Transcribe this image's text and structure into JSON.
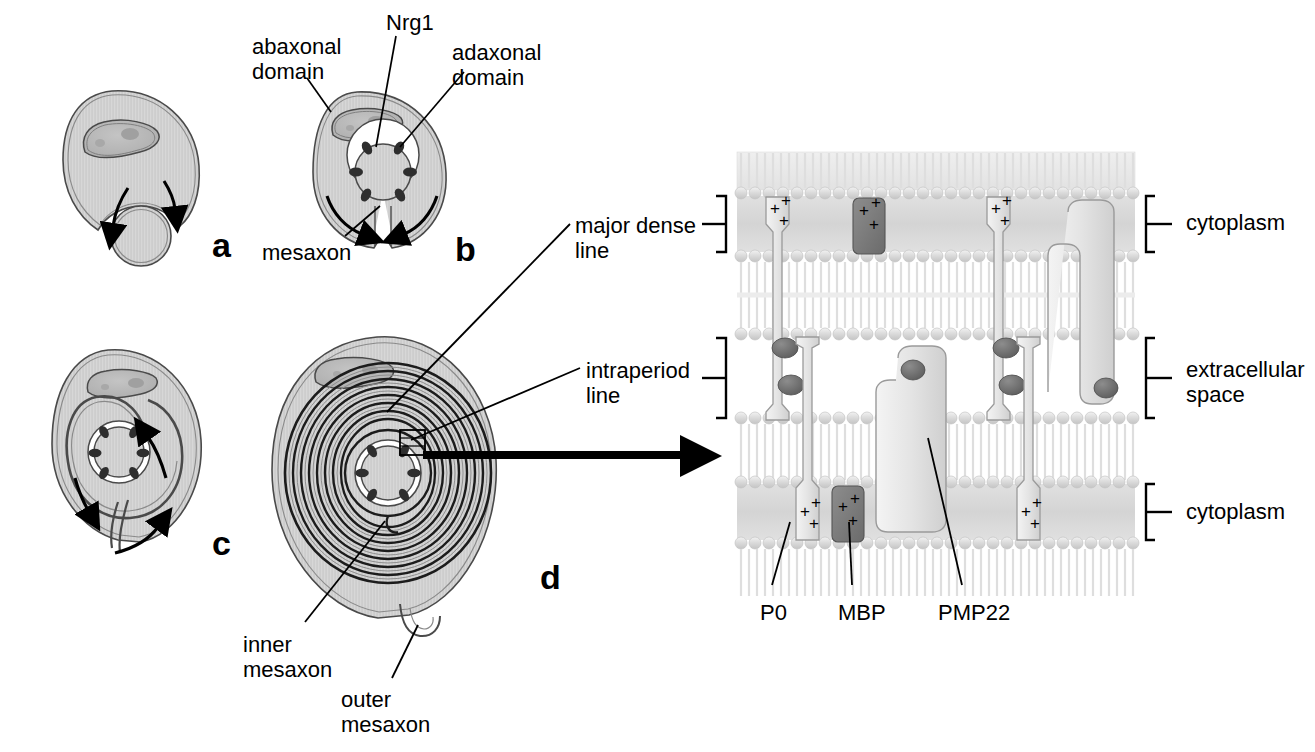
{
  "figure": {
    "background_color": "#ffffff",
    "ink_color": "#000000"
  },
  "panels": [
    {
      "id": "a",
      "letter": "a",
      "caption": "Schwann cell engulfing axon",
      "letter_x": 212,
      "letter_y": 228
    },
    {
      "id": "b",
      "letter": "b",
      "caption": "Axon surrounded, mesaxon formed",
      "letter_x": 455,
      "letter_y": 232
    },
    {
      "id": "c",
      "letter": "c",
      "caption": "Spiral wrapping begins",
      "letter_x": 212,
      "letter_y": 526
    },
    {
      "id": "d",
      "letter": "d",
      "caption": "Compact myelin with multiple lamellae",
      "letter_x": 540,
      "letter_y": 560
    }
  ],
  "annotations": {
    "abaxonal_domain": {
      "text": "abaxonal\ndomain",
      "x": 252,
      "y": 34
    },
    "nrg1": {
      "text": "Nrg1",
      "x": 386,
      "y": 10
    },
    "adaxonal_domain": {
      "text": "adaxonal\ndomain",
      "x": 452,
      "y": 40
    },
    "mesaxon": {
      "text": "mesaxon",
      "x": 262,
      "y": 240
    },
    "major_dense_line": {
      "text": "major dense\nline",
      "x": 575,
      "y": 213
    },
    "intraperiod_line": {
      "text": "intraperiod\nline",
      "x": 586,
      "y": 358
    },
    "inner_mesaxon": {
      "text": "inner\nmesaxon",
      "x": 243,
      "y": 632
    },
    "outer_mesaxon": {
      "text": "outer\nmesaxon",
      "x": 341,
      "y": 687
    },
    "cytoplasm_top": {
      "text": "cytoplasm",
      "x": 1186,
      "y": 210
    },
    "extracellular_space": {
      "text": "extracellular\nspace",
      "x": 1186,
      "y": 357
    },
    "cytoplasm_bottom": {
      "text": "cytoplasm",
      "x": 1186,
      "y": 499
    },
    "p0": {
      "text": "P0",
      "x": 760,
      "y": 600
    },
    "mbp": {
      "text": "MBP",
      "x": 838,
      "y": 600
    },
    "pmp22": {
      "text": "PMP22",
      "x": 938,
      "y": 600
    }
  },
  "membrane_diagram": {
    "proteins": [
      {
        "name": "P0",
        "role": "adhesion, extracellular Ig domain",
        "count": 4,
        "charge_marks": "+ + +"
      },
      {
        "name": "MBP",
        "role": "cytoplasmic, compacts major dense line",
        "count": 2,
        "charge_marks": "+ + +"
      },
      {
        "name": "PMP22",
        "role": "tetraspan transmembrane",
        "count": 2
      }
    ],
    "layers": [
      "cytoplasm",
      "membrane bilayer",
      "extracellular space",
      "membrane bilayer",
      "cytoplasm"
    ],
    "plus_symbol": "+"
  },
  "colors": {
    "cell_body": "#c9c9c9",
    "cell_body_light": "#d9d9d9",
    "nucleus": "#b4b4b4",
    "outline": "#3c3c3c",
    "myelin_dark": "#1a1a1a",
    "membrane_pale": "#e4e4e4",
    "membrane_head": "#d0d0d0",
    "protein_fill": "#e9e9e9",
    "mbp_fill": "#7a7a7a",
    "knob_fill": "#6e6e6e",
    "arrow_black": "#000000"
  }
}
